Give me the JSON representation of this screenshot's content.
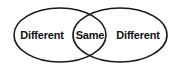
{
  "diagram": {
    "type": "venn",
    "stroke_color": "#1a1a1a",
    "background": "#ffffff",
    "sets": [
      {
        "name": "left-set",
        "cx": 60,
        "cy": 35,
        "rx": 46,
        "ry": 27
      },
      {
        "name": "right-set",
        "cx": 120,
        "cy": 35,
        "rx": 47,
        "ry": 27
      }
    ],
    "labels": {
      "left": "Different",
      "center": "Same",
      "right": "Different"
    }
  }
}
